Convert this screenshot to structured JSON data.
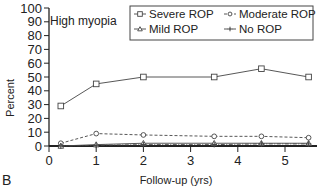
{
  "chart_data": {
    "type": "line",
    "title": "",
    "annotation": "High myopia",
    "panel_label": "B",
    "xlabel": "Follow-up (yrs)",
    "ylabel": "Percent",
    "xlim": [
      0,
      5.7
    ],
    "ylim": [
      0,
      100
    ],
    "xticks": [
      0,
      1,
      2,
      3,
      4,
      5
    ],
    "yticks": [
      0,
      10,
      20,
      30,
      40,
      50,
      60,
      70,
      80,
      90,
      100
    ],
    "grid": false,
    "legend_position": "upper right (boxed)",
    "x": [
      0.25,
      1,
      2,
      3.5,
      4.5,
      5.5
    ],
    "series": [
      {
        "name": "Severe ROP",
        "marker": "square",
        "line": "solid",
        "values": [
          29,
          45,
          50,
          50,
          56,
          50
        ]
      },
      {
        "name": "Moderate ROP",
        "marker": "circle",
        "line": "dashed",
        "values": [
          2,
          9,
          8,
          7,
          7,
          6
        ]
      },
      {
        "name": "Mild ROP",
        "marker": "triangle",
        "line": "solid",
        "values": [
          0,
          1,
          2,
          2,
          2,
          2
        ]
      },
      {
        "name": "No ROP",
        "marker": "star",
        "line": "dash-dot",
        "values": [
          0,
          0.5,
          1,
          1,
          1.5,
          1.5
        ]
      }
    ]
  },
  "colors": {
    "line": "#444444",
    "axis": "#222222",
    "background": "#ffffff"
  }
}
